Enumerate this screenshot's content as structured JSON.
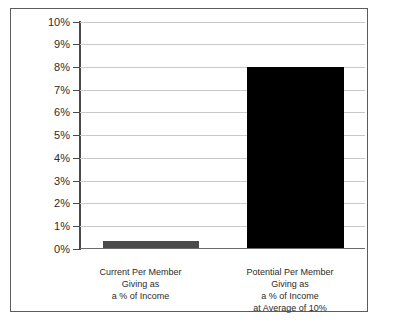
{
  "chart_data": {
    "type": "bar",
    "title": "",
    "subtitle": "",
    "xlabel": "",
    "ylabel": "",
    "ylim": [
      0,
      10
    ],
    "ytick_labels": [
      "10%",
      "9%",
      "8%",
      "7%",
      "6%",
      "5%",
      "4%",
      "3%",
      "2%",
      "1%",
      "0%"
    ],
    "ytick_values": [
      10,
      9,
      8,
      7,
      6,
      5,
      4,
      3,
      2,
      1,
      0
    ],
    "grid": "horizontal",
    "legend": "none",
    "categories": [
      "Current Per Member Giving as a % of Income",
      "Potential Per Member Giving as a % of Income at Average of 10%"
    ],
    "category_label_lines": [
      [
        "Current Per Member",
        "Giving as",
        "a % of Income"
      ],
      [
        "Potential Per Member",
        "Giving as",
        "a % of Income",
        "at Average of 10%"
      ]
    ],
    "values": [
      0.3,
      8.0
    ],
    "bar_colors": [
      "#4a4a4a",
      "#000000"
    ]
  },
  "axis": {
    "ticks": [
      {
        "label": "10%",
        "value": 10
      },
      {
        "label": "9%",
        "value": 9
      },
      {
        "label": "8%",
        "value": 8
      },
      {
        "label": "7%",
        "value": 7
      },
      {
        "label": "6%",
        "value": 6
      },
      {
        "label": "5%",
        "value": 5
      },
      {
        "label": "4%",
        "value": 4
      },
      {
        "label": "3%",
        "value": 3
      },
      {
        "label": "2%",
        "value": 2
      },
      {
        "label": "1%",
        "value": 1
      },
      {
        "label": "0%",
        "value": 0
      }
    ]
  },
  "bars": [
    {
      "name": "current-per-member-giving",
      "value": 0.3,
      "color": "#4a4a4a",
      "label_lines": [
        "Current Per Member",
        "Giving as",
        "a % of Income"
      ]
    },
    {
      "name": "potential-per-member-giving",
      "value": 8.0,
      "color": "#000000",
      "label_lines": [
        "Potential Per Member",
        "Giving as",
        "a % of Income",
        "at Average of 10%"
      ]
    }
  ],
  "colors": {
    "frame": "#5c5c5c",
    "gridline": "#c9c9c9",
    "axis": "#4a4a4a",
    "baseline": "#6b6b6b",
    "text": "#2b2b2b",
    "background": "#ffffff"
  }
}
